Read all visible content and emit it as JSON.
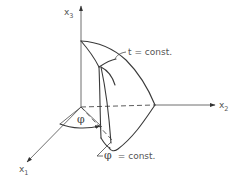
{
  "diagram": {
    "type": "3d-coordinate-surface-sketch",
    "axes": {
      "x1": {
        "label": "x",
        "subscript": "1"
      },
      "x2": {
        "label": "x",
        "subscript": "2"
      },
      "x3": {
        "label": "x",
        "subscript": "3"
      }
    },
    "annotations": {
      "t_const": "t = const.",
      "phi_symbol": "φ",
      "phi_const_symbol": "φ",
      "phi_const_text": "= const."
    },
    "colors": {
      "line": "#3a3a3a",
      "text": "#555555",
      "background": "#ffffff"
    }
  }
}
